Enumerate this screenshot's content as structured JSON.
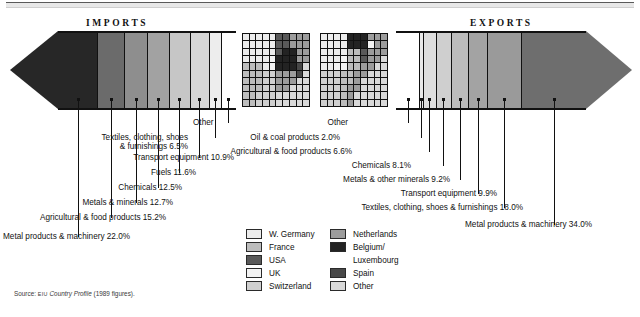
{
  "figure": {
    "imports_title": "IMPORTS",
    "exports_title": "EXPORTS",
    "source_prefix": "Source:",
    "source_org": "EIU",
    "source_title": "Country Profile",
    "source_suffix": "(1989 figures)."
  },
  "chart_data": {
    "type": "bar",
    "orientation": "horizontal-stacked-arrow",
    "xlabel": "",
    "ylabel": "",
    "note": "Two stacked 100% arrow bars: imports (left-pointing) and exports (right-pointing), plus two 10x10 waffle grids showing trading-partner shares.",
    "series": [
      {
        "name": "Imports",
        "unit": "%",
        "categories": [
          "Metal products & machinery",
          "Agricultural & food products",
          "Metals & minerals",
          "Chemicals",
          "Fuels",
          "Transport equipment",
          "Textiles, clothing, shoes & furnishings",
          "Other"
        ],
        "values": [
          22.0,
          15.2,
          12.7,
          12.5,
          11.6,
          10.9,
          6.5,
          8.6
        ],
        "labels": [
          "Metal products & machinery 22.0%",
          "Agricultural & food products 15.2%",
          "Metals & minerals 12.7%",
          "Chemicals 12.5%",
          "Fuels 11.6%",
          "Transport equipment 10.9%",
          "Textiles, clothing, shoes & furnishings 6.5%",
          "Other"
        ],
        "colors": [
          "#272727",
          "#6b6b6b",
          "#8e8e8e",
          "#a2a2a2",
          "#c6c6c6",
          "#d6d6d6",
          "#ededed",
          "#ffffff"
        ]
      },
      {
        "name": "Exports",
        "unit": "%",
        "categories": [
          "Other",
          "Oil & coal products",
          "Agricultural & food products",
          "Chemicals",
          "Metals & other minerals",
          "Transport equipment",
          "Textiles, clothing, shoes & furnishings",
          "Metal products & machinery"
        ],
        "values": [
          12.2,
          2.0,
          6.6,
          8.1,
          9.2,
          9.9,
          18.0,
          34.0
        ],
        "labels": [
          "Other",
          "Oil & coal products 2.0%",
          "Agricultural & food products 6.6%",
          "Chemicals 8.1%",
          "Metals & other minerals 9.2%",
          "Transport equipment 9.9%",
          "Textiles, clothing, shoes & furnishings 18.0%",
          "Metal products & machinery 34.0%"
        ],
        "colors": [
          "#ffffff",
          "#e9e9e9",
          "#dedede",
          "#cfcfcf",
          "#bcbcbc",
          "#a3a3a3",
          "#9a9a9a",
          "#6e6e6e"
        ]
      }
    ],
    "partners_legend": {
      "position": "bottom-center",
      "column_left": [
        {
          "label": "W. Germany",
          "color": "#ececec"
        },
        {
          "label": "France",
          "color": "#bdbdbd"
        },
        {
          "label": "USA",
          "color": "#595959"
        },
        {
          "label": "UK",
          "color": "#f3f3f3"
        },
        {
          "label": "Switzerland",
          "color": "#cfcfcf"
        }
      ],
      "column_right": [
        {
          "label": "Netherlands",
          "color": "#9c9c9c"
        },
        {
          "label": "Belgium/",
          "color": "#232323"
        },
        {
          "label": "Luxembourg",
          "color": null
        },
        {
          "label": "Spain",
          "color": "#484848"
        },
        {
          "label": "Other",
          "color": "#d9d9d9"
        }
      ]
    },
    "imports_partner_grid": {
      "rows": 10,
      "cols": 10,
      "cells": [
        "#ececec",
        "#ececec",
        "#ececec",
        "#ececec",
        "#ececec",
        "#595959",
        "#595959",
        "#9c9c9c",
        "#9c9c9c",
        "#9c9c9c",
        "#ececec",
        "#ececec",
        "#ececec",
        "#ececec",
        "#ececec",
        "#595959",
        "#595959",
        "#9c9c9c",
        "#9c9c9c",
        "#9c9c9c",
        "#ececec",
        "#ececec",
        "#ececec",
        "#ececec",
        "#ececec",
        "#595959",
        "#232323",
        "#232323",
        "#9c9c9c",
        "#9c9c9c",
        "#ececec",
        "#ececec",
        "#ececec",
        "#ececec",
        "#f3f3f3",
        "#232323",
        "#232323",
        "#232323",
        "#9c9c9c",
        "#9c9c9c",
        "#bdbdbd",
        "#bdbdbd",
        "#bdbdbd",
        "#ececec",
        "#f3f3f3",
        "#232323",
        "#232323",
        "#232323",
        "#484848",
        "#d9d9d9",
        "#bdbdbd",
        "#bdbdbd",
        "#bdbdbd",
        "#cfcfcf",
        "#cfcfcf",
        "#9c9c9c",
        "#9c9c9c",
        "#9c9c9c",
        "#484848",
        "#d9d9d9",
        "#bdbdbd",
        "#bdbdbd",
        "#bdbdbd",
        "#cfcfcf",
        "#cfcfcf",
        "#9c9c9c",
        "#9c9c9c",
        "#9c9c9c",
        "#d9d9d9",
        "#d9d9d9",
        "#bdbdbd",
        "#bdbdbd",
        "#bdbdbd",
        "#cfcfcf",
        "#cfcfcf",
        "#9c9c9c",
        "#9c9c9c",
        "#d9d9d9",
        "#d9d9d9",
        "#d9d9d9",
        "#bdbdbd",
        "#bdbdbd",
        "#cfcfcf",
        "#cfcfcf",
        "#cfcfcf",
        "#d9d9d9",
        "#d9d9d9",
        "#d9d9d9",
        "#d9d9d9",
        "#d9d9d9",
        "#bdbdbd",
        "#bdbdbd",
        "#cfcfcf",
        "#cfcfcf",
        "#cfcfcf",
        "#d9d9d9",
        "#d9d9d9",
        "#d9d9d9",
        "#d9d9d9",
        "#d9d9d9"
      ]
    },
    "exports_partner_grid": {
      "rows": 10,
      "cols": 10,
      "cells": [
        "#ececec",
        "#ececec",
        "#ececec",
        "#ececec",
        "#232323",
        "#232323",
        "#232323",
        "#9c9c9c",
        "#9c9c9c",
        "#9c9c9c",
        "#ececec",
        "#ececec",
        "#ececec",
        "#ececec",
        "#232323",
        "#232323",
        "#232323",
        "#f3f3f3",
        "#9c9c9c",
        "#9c9c9c",
        "#ececec",
        "#ececec",
        "#ececec",
        "#ececec",
        "#bdbdbd",
        "#bdbdbd",
        "#595959",
        "#9c9c9c",
        "#9c9c9c",
        "#9c9c9c",
        "#ececec",
        "#ececec",
        "#ececec",
        "#f3f3f3",
        "#bdbdbd",
        "#bdbdbd",
        "#595959",
        "#9c9c9c",
        "#9c9c9c",
        "#d9d9d9",
        "#ececec",
        "#ececec",
        "#f3f3f3",
        "#f3f3f3",
        "#bdbdbd",
        "#bdbdbd",
        "#9c9c9c",
        "#9c9c9c",
        "#d9d9d9",
        "#d9d9d9",
        "#cfcfcf",
        "#cfcfcf",
        "#cfcfcf",
        "#bdbdbd",
        "#bdbdbd",
        "#9c9c9c",
        "#9c9c9c",
        "#d9d9d9",
        "#d9d9d9",
        "#d9d9d9",
        "#cfcfcf",
        "#cfcfcf",
        "#cfcfcf",
        "#bdbdbd",
        "#bdbdbd",
        "#9c9c9c",
        "#d9d9d9",
        "#d9d9d9",
        "#d9d9d9",
        "#d9d9d9",
        "#cfcfcf",
        "#cfcfcf",
        "#cfcfcf",
        "#bdbdbd",
        "#9c9c9c",
        "#9c9c9c",
        "#d9d9d9",
        "#d9d9d9",
        "#d9d9d9",
        "#d9d9d9",
        "#cfcfcf",
        "#cfcfcf",
        "#cfcfcf",
        "#bdbdbd",
        "#9c9c9c",
        "#d9d9d9",
        "#d9d9d9",
        "#d9d9d9",
        "#d9d9d9",
        "#d9d9d9",
        "#cfcfcf",
        "#cfcfcf",
        "#cfcfcf",
        "#bdbdbd",
        "#9c9c9c",
        "#d9d9d9",
        "#d9d9d9",
        "#d9d9d9",
        "#d9d9d9",
        "#d9d9d9"
      ]
    }
  }
}
